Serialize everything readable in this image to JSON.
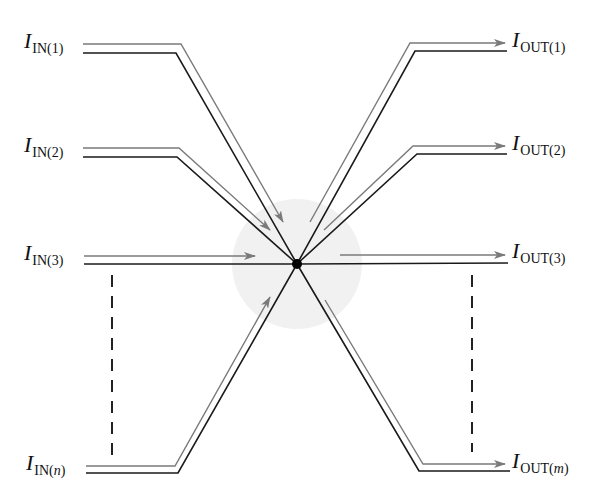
{
  "diagram": {
    "type": "current-node",
    "colors": {
      "wire": "#1a1a1a",
      "arrow": "#7a7a7a",
      "node_region": "#f0f0f0",
      "node": "#000000",
      "dashes": "#222222"
    },
    "node": {
      "cx": 297,
      "cy": 264,
      "r": 5,
      "region_r": 65
    },
    "inputs": [
      {
        "id": "in1",
        "symbol": "I",
        "sub_prefix": "IN(",
        "sub_var": "1",
        "sub_suffix": ")",
        "label_x": 24,
        "label_y": 30,
        "wire": "M83,53 L176,53 L297,264",
        "arrow": "M83,44 L181,44 L283,222"
      },
      {
        "id": "in2",
        "symbol": "I",
        "sub_prefix": "IN(",
        "sub_var": "2",
        "sub_suffix": ")",
        "label_x": 24,
        "label_y": 134,
        "wire": "M83,157 L177,157 L297,264",
        "arrow": "M83,148 L179,148 L270,230"
      },
      {
        "id": "in3",
        "symbol": "I",
        "sub_prefix": "IN(",
        "sub_var": "3",
        "sub_suffix": ")",
        "label_x": 24,
        "label_y": 242,
        "wire": "M84,264 L297,264",
        "arrow": "M84,256 L255,256"
      },
      {
        "id": "inn",
        "symbol": "I",
        "sub_prefix": "IN(",
        "sub_var": "n",
        "sub_suffix": ")",
        "var_italic": true,
        "label_x": 26,
        "label_y": 452,
        "wire": "M86,473 L178,473 L297,264",
        "arrow": "M86,466 L175,466 L270,297"
      }
    ],
    "outputs": [
      {
        "id": "out1",
        "symbol": "I",
        "sub_prefix": "OUT(",
        "sub_var": "1",
        "sub_suffix": ")",
        "label_x": 512,
        "label_y": 29,
        "wire": "M297,264 L415,51 L507,51",
        "arrow": "M310,222 L410,43 L505,43"
      },
      {
        "id": "out2",
        "symbol": "I",
        "sub_prefix": "OUT(",
        "sub_var": "2",
        "sub_suffix": ")",
        "label_x": 512,
        "label_y": 132,
        "wire": "M297,264 L417,154 L507,154",
        "arrow": "M324,230 L413,146 L505,146"
      },
      {
        "id": "out3",
        "symbol": "I",
        "sub_prefix": "OUT(",
        "sub_var": "3",
        "sub_suffix": ")",
        "label_x": 512,
        "label_y": 240,
        "wire": "M297,264 L508,263",
        "arrow": "M340,255 L505,255"
      },
      {
        "id": "outm",
        "symbol": "I",
        "sub_prefix": "OUT(",
        "sub_var": "m",
        "sub_suffix": ")",
        "var_italic": true,
        "label_x": 512,
        "label_y": 450,
        "wire": "M297,264 L419,471 L510,471",
        "arrow": "M325,300 L423,464 L505,464"
      }
    ],
    "ellipsis": [
      {
        "id": "in-ellipsis",
        "x": 112,
        "y1": 275,
        "y2": 455
      },
      {
        "id": "out-ellipsis",
        "x": 472,
        "y1": 275,
        "y2": 452
      }
    ]
  },
  "labels": {
    "in1": {
      "main": "I",
      "sub": "IN(1)"
    },
    "in2": {
      "main": "I",
      "sub": "IN(2)"
    },
    "in3": {
      "main": "I",
      "sub": "IN(3)"
    },
    "inn": {
      "main": "I",
      "sub_pre": "IN(",
      "sub_var": "n",
      "sub_post": ")"
    },
    "out1": {
      "main": "I",
      "sub": "OUT(1)"
    },
    "out2": {
      "main": "I",
      "sub": "OUT(2)"
    },
    "out3": {
      "main": "I",
      "sub": "OUT(3)"
    },
    "outm": {
      "main": "I",
      "sub_pre": "OUT(",
      "sub_var": "m",
      "sub_post": ")"
    }
  }
}
